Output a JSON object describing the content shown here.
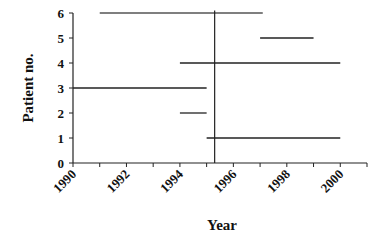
{
  "chart_data": {
    "type": "line",
    "subtype": "interval-timeline",
    "title": "",
    "xlabel": "Year",
    "ylabel": "Patient no.",
    "xlim": [
      1990,
      2001
    ],
    "ylim": [
      0,
      6
    ],
    "x_ticks": [
      1990,
      1991,
      1992,
      1993,
      1994,
      1995,
      1996,
      1997,
      1998,
      1999,
      2000,
      2001
    ],
    "x_tick_labels": [
      "1990",
      "1992",
      "1994",
      "1996",
      "1998",
      "2000"
    ],
    "x_tick_label_values": [
      1990,
      1992,
      1994,
      1996,
      1998,
      2000
    ],
    "y_ticks": [
      0,
      1,
      2,
      3,
      4,
      5,
      6
    ],
    "y_tick_labels": [
      "0",
      "1",
      "2",
      "3",
      "4",
      "5",
      "6"
    ],
    "grid": false,
    "legend": null,
    "series": [
      {
        "name": "Patient 1",
        "patient": 1,
        "start": 1995.0,
        "end": 2000.0,
        "color": "#222222"
      },
      {
        "name": "Patient 2",
        "patient": 2,
        "start": 1994.0,
        "end": 1995.0,
        "color": "#222222"
      },
      {
        "name": "Patient 3",
        "patient": 3,
        "start": 1990.0,
        "end": 1995.0,
        "color": "#222222"
      },
      {
        "name": "Patient 4",
        "patient": 4,
        "start": 1994.0,
        "end": 2000.0,
        "color": "#222222"
      },
      {
        "name": "Patient 5",
        "patient": 5,
        "start": 1997.0,
        "end": 1999.0,
        "color": "#222222"
      },
      {
        "name": "Patient 6",
        "patient": 6,
        "start": 1991.0,
        "end": 1997.1,
        "color": "#555555"
      }
    ],
    "annotations": [
      {
        "type": "vertical-line",
        "x": 1995.3,
        "y_from": 0,
        "y_to": 6.1,
        "color": "#222222"
      }
    ]
  }
}
